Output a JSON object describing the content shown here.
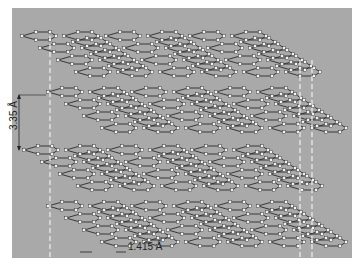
{
  "figure": {
    "layer_count": 4,
    "background_color": "#a9a9a9",
    "bond_color": "#2a2a2a",
    "atom_color": "#f4f4f4",
    "guide_color": "#f2f2f2"
  },
  "annotations": {
    "interlayer_spacing": "3.35 Å",
    "bond_length": "1.415 Å"
  }
}
